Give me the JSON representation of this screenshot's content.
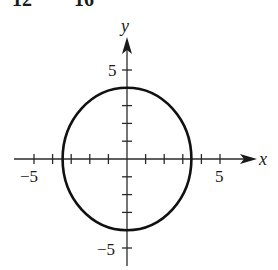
{
  "header_fragment": {
    "left": "12",
    "right": "16"
  },
  "chart_data": {
    "type": "line",
    "title": "",
    "equation_hint": "x^2/12 + y^2/16 = 1",
    "xlabel": "x",
    "ylabel": "y",
    "xlim": [
      -5.5,
      6.8
    ],
    "ylim": [
      -6.3,
      6.8
    ],
    "x_ticks": [
      -5,
      -4,
      -3,
      -2,
      -1,
      1,
      2,
      3,
      4,
      5
    ],
    "y_ticks": [
      -5,
      -4,
      -3,
      -2,
      -1,
      1,
      2,
      3,
      4,
      5
    ],
    "x_tick_labels": [
      {
        "value": -5,
        "label": "−5"
      },
      {
        "value": 5,
        "label": "5"
      }
    ],
    "y_tick_labels": [
      {
        "value": 5,
        "label": "5"
      },
      {
        "value": -5,
        "label": "−5"
      }
    ],
    "grid": false,
    "legend": null,
    "series": [
      {
        "name": "ellipse",
        "shape": "ellipse",
        "center": [
          0,
          0
        ],
        "semi_axis_x": 3.46,
        "semi_axis_y": 4,
        "intercepts": {
          "x": [
            -3.46,
            3.46
          ],
          "y": [
            -4,
            4
          ]
        }
      }
    ]
  },
  "labels": {
    "x_axis": "x",
    "y_axis": "y",
    "x_neg5": "−5",
    "x_pos5": "5",
    "y_pos5": "5",
    "y_neg5": "−5"
  }
}
